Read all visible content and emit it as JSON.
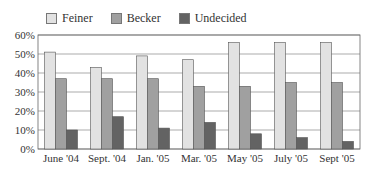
{
  "chart_data": {
    "type": "bar",
    "title": "",
    "xlabel": "",
    "ylabel": "",
    "ylim": [
      0,
      60
    ],
    "y_ticks": [
      "0%",
      "10%",
      "20%",
      "30%",
      "40%",
      "50%",
      "60%"
    ],
    "grid": true,
    "legend_position": "top",
    "categories": [
      "June '04",
      "Sept. '04",
      "Jan. '05",
      "Mar. '05",
      "May '05",
      "July '05",
      "Sept '05"
    ],
    "series": [
      {
        "name": "Feiner",
        "color": "#e2e2e2",
        "values": [
          51,
          43,
          49,
          47,
          56,
          56,
          56
        ]
      },
      {
        "name": "Becker",
        "color": "#a0a0a0",
        "values": [
          37,
          37,
          37,
          33,
          33,
          35,
          35
        ]
      },
      {
        "name": "Undecided",
        "color": "#636363",
        "values": [
          10,
          17,
          11,
          14,
          8,
          6,
          4
        ]
      }
    ]
  }
}
